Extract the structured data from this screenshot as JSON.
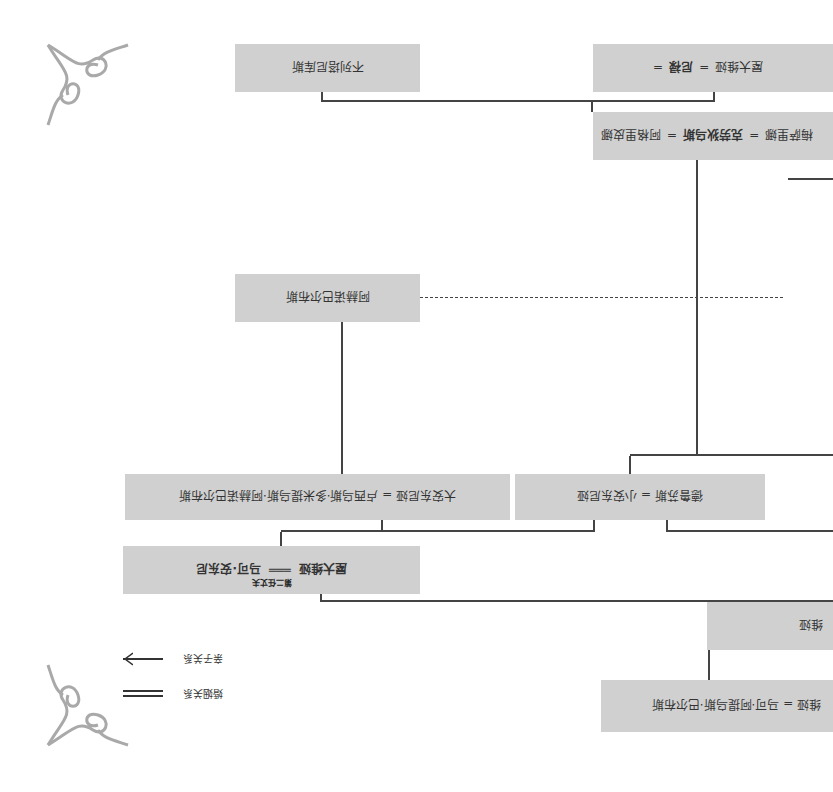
{
  "diagram": {
    "orientation_deg": 180,
    "colors": {
      "box_fill": "#d0d0d0",
      "line": "#444444",
      "text": "#333333",
      "background": "#ffffff"
    },
    "nodes": [
      {
        "id": "balbus",
        "text": "维娅 = 马可·阿提乌斯·巴尔布斯",
        "parts": [
          "马可·阿提乌斯·巴尔布斯",
          "="
        ],
        "cut": true
      },
      {
        "id": "atia",
        "text": "维娅",
        "cut": true
      },
      {
        "id": "octavia_antony",
        "left": "屋大维娅",
        "right": "马可·安东尼",
        "marriage_sep": "═══",
        "note": "第二任丈夫"
      },
      {
        "id": "antonia_major",
        "text": "大安东尼娅 = 卢西乌斯·多米提乌斯·阿赫诺巴尔布斯"
      },
      {
        "id": "antonia_minor",
        "text": "德鲁苏斯 = 小安东尼娅"
      },
      {
        "id": "ahenobarbus",
        "text": "阿赫诺巴尔布斯"
      },
      {
        "id": "claudius",
        "left": "梅萨里娜",
        "middle": "克劳狄乌斯",
        "right": "阿格里皮娜",
        "sep": "="
      },
      {
        "id": "britannicus",
        "text": "不列塔尼库斯"
      },
      {
        "id": "nero",
        "left": "屋大维娅",
        "right": "尼禄",
        "sep": "="
      }
    ],
    "legend": [
      {
        "label": "亲子关系",
        "symbol": "arrow"
      },
      {
        "label": "婚姻关系",
        "symbol": "double-line"
      }
    ]
  }
}
